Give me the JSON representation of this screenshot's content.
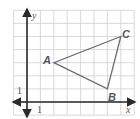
{
  "diagram": {
    "type": "coordinate-plane-triangle",
    "axes": {
      "x_label": "x",
      "y_label": "y",
      "x_tick_label": "1",
      "y_tick_label": "1"
    },
    "grid": {
      "x_min": -1,
      "x_max": 8,
      "y_min": -1,
      "y_max": 7,
      "unit": 1
    },
    "vertices": [
      {
        "name": "A",
        "x": 2,
        "y": 3
      },
      {
        "name": "B",
        "x": 6,
        "y": 1
      },
      {
        "name": "C",
        "x": 7,
        "y": 5
      }
    ],
    "colors": {
      "grid": "#cfcfcf",
      "axes": "#2a2a2a",
      "triangle": "#6a6a72",
      "labels": "#555560"
    }
  }
}
